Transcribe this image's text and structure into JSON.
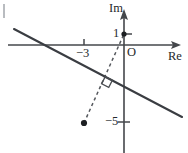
{
  "figure": {
    "kind": "complex-plane-diagram",
    "width": 188,
    "height": 153,
    "background_color": "#ffffff",
    "ink_color": "#3a3d42"
  },
  "axes": {
    "real": {
      "label": "Re",
      "label_x": 168,
      "label_y": 50,
      "y_pixel": 45,
      "x_start": 8,
      "x_end": 181,
      "arrow": "arrow-right"
    },
    "imaginary": {
      "label": "Im",
      "label_x": 109,
      "label_y": 2,
      "x_pixel": 124,
      "y_start": 10,
      "y_end": 153,
      "arrow": "arrow-up"
    },
    "origin": {
      "label": "O",
      "label_x": 127,
      "label_y": 46
    }
  },
  "ticks": [
    {
      "id": "tick-real-minus3",
      "axis": "real",
      "label": "−3",
      "value": -3,
      "x_pixel": 84,
      "y_pixel": 45,
      "label_x": 76,
      "label_y": 47
    },
    {
      "id": "tick-imag-1",
      "axis": "imaginary",
      "label": "1",
      "value": 1,
      "x_pixel": 124,
      "y_pixel": 34,
      "label_x": 113,
      "label_y": 27
    },
    {
      "id": "tick-imag-minus5",
      "axis": "imaginary",
      "label": "−5",
      "value": -5,
      "x_pixel": 124,
      "y_pixel": 122,
      "label_x": 105,
      "label_y": 115
    }
  ],
  "points": [
    {
      "id": "point-on-imaginary-axis",
      "label": "1",
      "x_pixel": 124,
      "y_pixel": 34,
      "radius": 2.4,
      "style": "filled"
    },
    {
      "id": "point-lower-left",
      "label": "",
      "x_pixel": 84,
      "y_pixel": 123,
      "radius": 3.0,
      "style": "filled"
    }
  ],
  "lines": {
    "solid_locus": {
      "id": "perpendicular-bisector",
      "style": "solid",
      "x1": 14,
      "y1": 29,
      "x2": 182,
      "y2": 117
    },
    "dashed_connector": {
      "id": "segment-between-points",
      "style": "dashed",
      "x1": 84,
      "y1": 123,
      "x2": 124,
      "y2": 34
    }
  },
  "markers": {
    "right_angle": {
      "id": "right-angle-marker",
      "center_x": 107,
      "center_y": 82,
      "size": 8,
      "rotation_deg": 27
    }
  },
  "edge_artifact": {
    "id": "cropped-bracket-fragment",
    "x": 3,
    "y": 4,
    "width": 2,
    "height": 14
  }
}
